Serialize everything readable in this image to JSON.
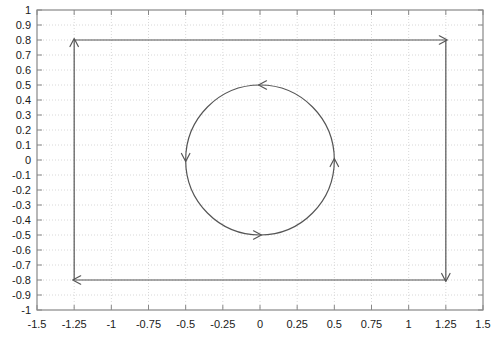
{
  "chart_data": {
    "type": "line",
    "title": "",
    "xlabel": "",
    "ylabel": "",
    "xlim": [
      -1.5,
      1.5
    ],
    "ylim": [
      -1,
      1
    ],
    "grid": true,
    "grid_style": "dotted",
    "grid_color": "#d8d8d8",
    "legend": "none",
    "background_color": "#ffffff",
    "axis_color": "#888888",
    "curve_color": "#555555",
    "xticks": [
      -1.5,
      -1.25,
      -1,
      -0.75,
      -0.5,
      -0.25,
      0,
      0.25,
      0.5,
      0.75,
      1,
      1.25,
      1.5
    ],
    "xtick_labels": [
      "-1.5",
      "-1.25",
      "-1",
      "-0.75",
      "-0.5",
      "-0.25",
      "0",
      "0.25",
      "0.5",
      "0.75",
      "1",
      "1.25",
      "1.5"
    ],
    "yticks": [
      1,
      0.9,
      0.8,
      0.7,
      0.6,
      0.5,
      0.4,
      0.3,
      0.2,
      0.1,
      0,
      -0.1,
      -0.2,
      -0.3,
      -0.4,
      -0.5,
      -0.6,
      -0.7,
      -0.8,
      -0.9,
      -1
    ],
    "ytick_labels": [
      "1",
      "0.9",
      "0.8",
      "0.7",
      "0.6",
      "0.5",
      "0.4",
      "0.3",
      "0.2",
      "0.1",
      "0",
      "-0.1",
      "-0.2",
      "-0.3",
      "-0.4",
      "-0.5",
      "-0.6",
      "-0.7",
      "-0.8",
      "-0.9",
      "-1"
    ],
    "series": [
      {
        "name": "rectangular-path",
        "shape": "rectangle",
        "direction": "clockwise",
        "x_range": [
          -1.25,
          1.25
        ],
        "y_range": [
          -0.8,
          0.8
        ],
        "vertices": [
          [
            -1.25,
            -0.8
          ],
          [
            -1.25,
            0.8
          ],
          [
            1.25,
            0.8
          ],
          [
            1.25,
            -0.8
          ]
        ],
        "arrow_markers": [
          {
            "x": -1.25,
            "y": 0.8,
            "points": "up"
          },
          {
            "x": 1.25,
            "y": 0.8,
            "points": "right"
          },
          {
            "x": 1.25,
            "y": -0.8,
            "points": "down"
          },
          {
            "x": -1.25,
            "y": -0.8,
            "points": "left"
          }
        ]
      },
      {
        "name": "circular-path",
        "shape": "circle",
        "direction": "counterclockwise",
        "center": [
          0,
          0
        ],
        "radius": 0.5,
        "arrow_markers": [
          {
            "x": 0,
            "y": 0.5,
            "points": "left"
          },
          {
            "x": -0.5,
            "y": 0,
            "points": "down"
          },
          {
            "x": 0,
            "y": -0.5,
            "points": "right"
          },
          {
            "x": 0.5,
            "y": 0,
            "points": "up"
          }
        ]
      }
    ]
  }
}
